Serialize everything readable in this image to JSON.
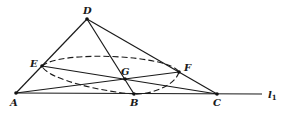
{
  "figure": {
    "type": "geometry-diagram",
    "points": {
      "A": {
        "label": "A",
        "x": 16,
        "y": 93
      },
      "B": {
        "label": "B",
        "x": 134,
        "y": 94
      },
      "C": {
        "label": "C",
        "x": 217,
        "y": 94
      },
      "D": {
        "label": "D",
        "x": 87,
        "y": 19
      },
      "E": {
        "label": "E",
        "x": 42,
        "y": 66
      },
      "F": {
        "label": "F",
        "x": 179,
        "y": 72
      },
      "G": {
        "label": "G",
        "x": 125,
        "y": 79
      }
    },
    "line_label": "l",
    "line_label_sub": "1",
    "segments": [
      [
        "A",
        "D"
      ],
      [
        "D",
        "C"
      ],
      [
        "D",
        "B"
      ],
      [
        "A",
        "F"
      ],
      [
        "E",
        "C"
      ],
      [
        "A",
        "C"
      ]
    ],
    "ellipse": {
      "style": "dashed",
      "through": [
        "E",
        "F",
        "B"
      ]
    },
    "colors": {
      "ink": "#1a1a1a",
      "background": "#ffffff"
    }
  }
}
